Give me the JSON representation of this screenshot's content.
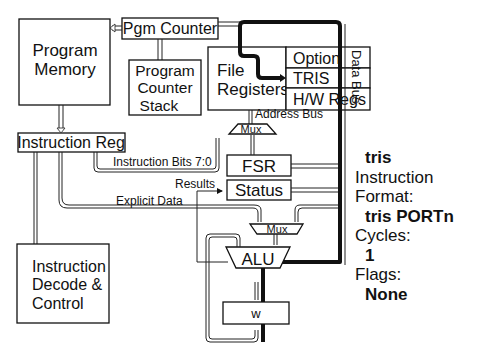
{
  "diagram": {
    "blocks": {
      "program_memory": [
        "Program",
        "Memory"
      ],
      "pgm_counter": "Pgm Counter",
      "pc_stack": [
        "Program",
        "Counter",
        "Stack"
      ],
      "file_registers": [
        "File",
        "Registers"
      ],
      "option": "Option",
      "tris": "TRIS",
      "hw_regs": "H/W Regs",
      "instruction_reg": "Instruction Reg",
      "fsr": "FSR",
      "status": "Status",
      "alu": "ALU",
      "w": "w",
      "decode": [
        "Instruction",
        "Decode &",
        "Control"
      ],
      "mux_top": "Mux",
      "mux_bottom": "Mux"
    },
    "labels": {
      "data_bus": "Data Bus",
      "address_bus": "Address Bus",
      "instruction_bits": "Instruction Bits 7:0",
      "results": "Results",
      "explicit_data": "Explicit Data"
    },
    "colors": {
      "line": "#111111",
      "background": "#ffffff"
    }
  },
  "info": {
    "instruction": "tris",
    "format_label": "Instruction Format:",
    "format_value": "tris PORTn",
    "cycles_label": "Cycles:",
    "cycles_value": "1",
    "flags_label": "Flags:",
    "flags_value": "None"
  }
}
